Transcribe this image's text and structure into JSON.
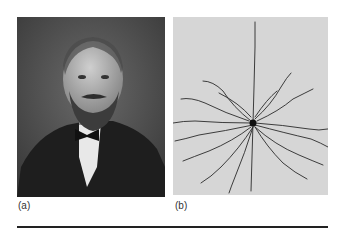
{
  "figure": {
    "panels": [
      {
        "label": "(a)",
        "content": "Portrait photograph of bearded man in dark suit with bow tie"
      },
      {
        "label": "(b)",
        "content": "Hand drawing of pyramidal neuron with branching dendrites"
      }
    ]
  },
  "colors": {
    "photo_bg": "#4a4a4a",
    "drawing_bg": "#d6d6d6",
    "ink": "#2a2a2a"
  }
}
